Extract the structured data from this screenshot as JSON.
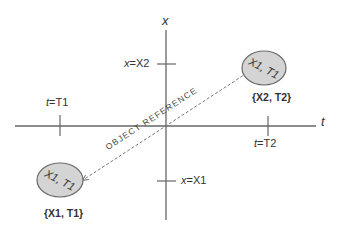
{
  "diagram": {
    "axes": {
      "vertical_label": "x",
      "horizontal_label": "t"
    },
    "ticks": {
      "x2": {
        "var": "x",
        "value": "X2"
      },
      "x1": {
        "var": "x",
        "value": "X1"
      },
      "t1": {
        "var": "t",
        "value": "T1"
      },
      "t2": {
        "var": "t",
        "value": "T2"
      }
    },
    "objects": [
      {
        "id": "source",
        "inner_text": "X1, T1",
        "caption": "{X2, T2}"
      },
      {
        "id": "target",
        "inner_text": "X1, T1",
        "caption": "{X1, T1}"
      }
    ],
    "reference_label": "OBJECT REFERENCE",
    "colors": {
      "axis": "#555555",
      "ellipse_fill": "#d4d4d4",
      "ellipse_stroke": "#6a6a6a",
      "dashed_line": "#777777",
      "text": "#222222"
    }
  }
}
